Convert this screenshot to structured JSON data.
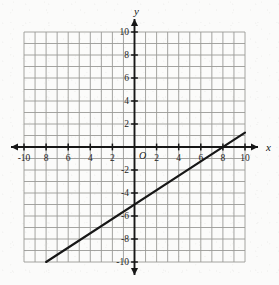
{
  "chart_data": {
    "type": "line",
    "title": "",
    "xlabel": "x",
    "ylabel": "y",
    "xlim": [
      -10,
      10
    ],
    "ylim": [
      -10,
      10
    ],
    "grid": true,
    "grid_step": 1,
    "legend": "none",
    "origin_label": "O",
    "x_tick_labels": [
      "-10",
      "8",
      "6",
      "4",
      "2",
      "2",
      "4",
      "6",
      "8",
      "10"
    ],
    "x_tick_values": [
      -10,
      -8,
      -6,
      -4,
      -2,
      2,
      4,
      6,
      8,
      10
    ],
    "y_tick_labels": [
      "10",
      "8",
      "6",
      "4",
      "2",
      "-2",
      "-4",
      "-6",
      "-8",
      "-10"
    ],
    "y_tick_values": [
      10,
      8,
      6,
      4,
      2,
      -2,
      -4,
      -6,
      -8,
      -10
    ],
    "series": [
      {
        "name": "line",
        "slope": 0.625,
        "intercept": -5,
        "x_intercept": 8,
        "y_intercept": -5,
        "points": [
          {
            "x": -8,
            "y": -10
          },
          {
            "x": 10,
            "y": 1.25
          }
        ]
      }
    ],
    "axis_arrows": [
      "left",
      "right",
      "up",
      "down"
    ],
    "line_color": "#171717",
    "grid_color": "#9a9a96",
    "axis_color": "#171717"
  },
  "figure": {
    "x_axis_label": "x",
    "y_axis_label": "y",
    "origin": "O"
  }
}
